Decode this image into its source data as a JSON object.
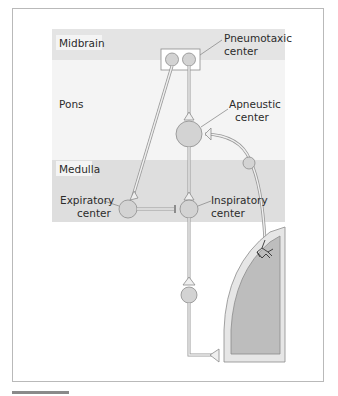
{
  "diagram": {
    "regions": [
      {
        "id": "midbrain",
        "label": "Midbrain",
        "color": "#e4e4e4"
      },
      {
        "id": "pons",
        "label": "Pons",
        "color": "#f3f3f3"
      },
      {
        "id": "medulla",
        "label": "Medulla",
        "color": "#dedede"
      }
    ],
    "centers": {
      "pneumotaxic": {
        "line1": "Pneumotaxic",
        "line2": "center"
      },
      "apneustic": {
        "line1": "Apneustic",
        "line2": "center"
      },
      "expiratory": {
        "line1": "Expiratory",
        "line2": "center"
      },
      "inspiratory": {
        "line1": "Inspiratory",
        "line2": "center"
      }
    },
    "colors": {
      "neuron_fill": "#d3d3d3",
      "neuron_stroke": "#8c8c8c",
      "lung_outer": "#e6e6e6",
      "lung_inner": "#bdbdbd"
    }
  }
}
